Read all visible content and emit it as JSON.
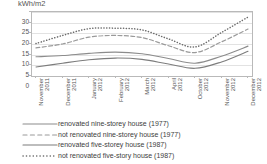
{
  "chart_data": {
    "type": "line",
    "title": "",
    "subtitle": "",
    "ylabel": "kWh/m2",
    "xlabel": "",
    "ylim": [
      0,
      30
    ],
    "yticks": [
      30,
      25,
      20,
      15,
      10,
      5,
      0
    ],
    "grid": true,
    "legend_position": "bottom",
    "categories": [
      "November 2011",
      "December 2011",
      "January 2012",
      "February 2012",
      "March 2012",
      "April 2012",
      "October 2012",
      "November 2012",
      "December 2012"
    ],
    "series": [
      {
        "name": "renovated nine-storey house (1977)",
        "style": "solid",
        "color": "#8c8c8c",
        "values": [
          9.0,
          9.6,
          10.6,
          11.2,
          10.4,
          8.2,
          6.0,
          9.3,
          14.0
        ]
      },
      {
        "name": "not renovated nine-storey house (1977)",
        "style": "dashed",
        "color": "#9a9a9a",
        "values": [
          13.2,
          15.0,
          18.2,
          19.0,
          18.0,
          14.2,
          11.0,
          16.0,
          22.0
        ]
      },
      {
        "name": "renovated five-storey house (1987)",
        "style": "solid",
        "color": "#7d7d7d",
        "values": [
          4.2,
          6.0,
          7.6,
          8.4,
          7.8,
          5.6,
          3.6,
          6.6,
          11.6
        ]
      },
      {
        "name": "not renovated five-story house (1987)",
        "style": "dotted",
        "color": "#6b6b6b",
        "values": [
          15.2,
          19.0,
          22.2,
          22.4,
          21.6,
          17.4,
          13.6,
          20.4,
          27.6
        ]
      }
    ]
  },
  "legend": {
    "items": [
      {
        "label": "renovated nine-storey house (1977)",
        "style": "solid"
      },
      {
        "label": "not renovated nine-storey house (1977)",
        "style": "dashed"
      },
      {
        "label": "renovated five-storey house (1987)",
        "style": "solid"
      },
      {
        "label": "not renovated five-story house (1987)",
        "style": "dotted"
      }
    ]
  }
}
